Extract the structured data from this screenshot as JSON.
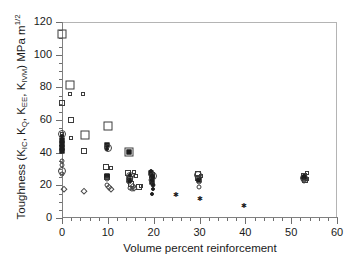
{
  "chart_data": {
    "type": "scatter",
    "title": "",
    "xlabel": "Volume percent reinforcement",
    "ylabel_plain": "Toughness (KIC, KQ, KEE, KIVM) MPa m1/2",
    "ylabel_parts": {
      "lead": "Toughness (K",
      "sub1": "IC",
      "sep1": ", K",
      "sub2": "Q",
      "sep2": ", K",
      "sub3": "EE",
      "sep3": ", K",
      "sub4": "IVM",
      "tail": ") MPa m",
      "sup": "1/2"
    },
    "xlim": [
      0,
      60
    ],
    "ylim": [
      0,
      120
    ],
    "xticks": [
      0,
      10,
      20,
      30,
      40,
      50,
      60
    ],
    "yticks": [
      0,
      20,
      40,
      60,
      80,
      100,
      120
    ],
    "x_minor_step": 2,
    "y_minor_step": 5,
    "grid": false,
    "legend": "none",
    "frame_color": "#b4b4b4",
    "marker_color": "#1e1e1e",
    "series": [
      {
        "name": "open-square-large",
        "marker": "square-open",
        "size": 9,
        "points": [
          [
            0.0,
            112.5
          ],
          [
            1.8,
            81.5
          ],
          [
            5.0,
            51.0
          ],
          [
            10.0,
            56.5
          ],
          [
            14.7,
            40.5
          ]
        ]
      },
      {
        "name": "open-square-medium",
        "marker": "square-open",
        "size": 6,
        "points": [
          [
            0.0,
            70.5
          ],
          [
            1.9,
            60.0
          ],
          [
            4.9,
            40.8
          ],
          [
            9.7,
            31.5
          ],
          [
            9.9,
            25.0
          ],
          [
            14.4,
            27.5
          ],
          [
            14.8,
            24.0
          ],
          [
            15.1,
            21.0
          ],
          [
            16.9,
            18.8
          ],
          [
            19.6,
            26.5
          ],
          [
            29.7,
            27.0
          ],
          [
            29.6,
            24.5
          ],
          [
            52.8,
            26.0
          ],
          [
            53.0,
            23.5
          ]
        ]
      },
      {
        "name": "open-square-small",
        "marker": "square-open",
        "size": 4,
        "points": [
          [
            1.7,
            76.0
          ],
          [
            4.6,
            76.0
          ],
          [
            0.0,
            51.5
          ],
          [
            1.9,
            49.0
          ],
          [
            10.7,
            30.5
          ],
          [
            15.6,
            28.0
          ],
          [
            16.2,
            25.5
          ],
          [
            17.2,
            19.5
          ],
          [
            19.9,
            25.0
          ],
          [
            30.3,
            25.5
          ],
          [
            53.5,
            27.5
          ],
          [
            53.4,
            24.0
          ]
        ]
      },
      {
        "name": "filled-square",
        "marker": "square-filled",
        "size": 5,
        "points": [
          [
            0.0,
            48.0
          ],
          [
            0.0,
            45.5
          ],
          [
            0.0,
            43.0
          ],
          [
            0.0,
            41.0
          ],
          [
            9.9,
            44.5
          ],
          [
            9.8,
            26.0
          ],
          [
            14.6,
            40.5
          ],
          [
            14.7,
            23.5
          ],
          [
            19.5,
            27.5
          ],
          [
            19.6,
            25.0
          ],
          [
            19.7,
            22.0
          ],
          [
            29.8,
            23.0
          ],
          [
            52.9,
            24.5
          ]
        ]
      },
      {
        "name": "open-circle-large",
        "marker": "circle-open",
        "size": 8,
        "points": [
          [
            0.0,
            51.5
          ],
          [
            0.0,
            29.0
          ],
          [
            10.0,
            43.0
          ],
          [
            14.9,
            25.5
          ],
          [
            19.8,
            25.5
          ],
          [
            29.7,
            26.5
          ],
          [
            52.9,
            24.5
          ]
        ]
      },
      {
        "name": "open-circle-small",
        "marker": "circle-open",
        "size": 5,
        "points": [
          [
            0.0,
            35.0
          ],
          [
            0.0,
            32.5
          ],
          [
            0.0,
            27.0
          ],
          [
            9.8,
            24.0
          ],
          [
            9.9,
            20.5
          ],
          [
            14.6,
            22.0
          ],
          [
            14.9,
            18.5
          ],
          [
            15.2,
            17.5
          ],
          [
            19.4,
            23.5
          ],
          [
            19.8,
            20.0
          ],
          [
            29.8,
            22.0
          ],
          [
            29.9,
            19.0
          ],
          [
            52.7,
            22.5
          ]
        ]
      },
      {
        "name": "filled-circle",
        "marker": "circle-filled",
        "size": 4,
        "points": [
          [
            0.0,
            50.5
          ],
          [
            0.0,
            47.0
          ],
          [
            0.0,
            44.0
          ],
          [
            0.0,
            42.0
          ],
          [
            9.9,
            42.5
          ],
          [
            14.8,
            26.5
          ],
          [
            14.9,
            22.5
          ],
          [
            19.5,
            28.5
          ],
          [
            19.6,
            26.0
          ],
          [
            19.7,
            23.0
          ],
          [
            19.8,
            20.5
          ],
          [
            19.9,
            17.5
          ],
          [
            19.6,
            15.0
          ],
          [
            29.6,
            23.5
          ],
          [
            52.8,
            25.5
          ]
        ]
      },
      {
        "name": "open-diamond",
        "marker": "diamond-open",
        "size": 6,
        "points": [
          [
            0.4,
            17.5
          ],
          [
            4.8,
            16.5
          ],
          [
            10.3,
            19.0
          ],
          [
            10.6,
            18.0
          ],
          [
            15.4,
            19.5
          ],
          [
            15.7,
            18.5
          ]
        ]
      },
      {
        "name": "star-points",
        "marker": "star",
        "size": 7,
        "points": [
          [
            24.8,
            14.8
          ],
          [
            30.0,
            12.0
          ],
          [
            39.6,
            8.0
          ]
        ]
      }
    ]
  }
}
